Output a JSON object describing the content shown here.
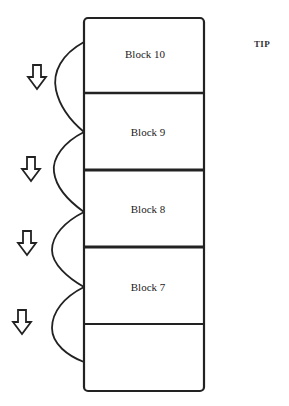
{
  "diagram": {
    "tip_label": "TIP",
    "stroke_color": "#222222",
    "background": "#ffffff",
    "blocks": [
      {
        "label": "Block 10"
      },
      {
        "label": "Block 9"
      },
      {
        "label": "Block 8"
      },
      {
        "label": "Block 7"
      },
      {
        "label": ""
      }
    ],
    "arrows": [
      {
        "direction": "down"
      },
      {
        "direction": "down"
      },
      {
        "direction": "down"
      },
      {
        "direction": "down"
      }
    ]
  }
}
